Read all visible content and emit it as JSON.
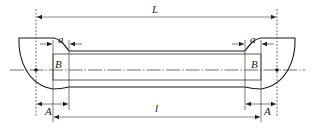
{
  "diagram": {
    "labels": {
      "overall_length": "L",
      "gauge_length": "l",
      "end_length_left": "A",
      "end_length_right": "A",
      "transition_left": "a",
      "transition_right": "a",
      "marker_left": "B",
      "marker_right": "B"
    },
    "colors": {
      "line": "#1a1a1a",
      "dim_line": "#555555",
      "background": "#ffffff"
    }
  }
}
